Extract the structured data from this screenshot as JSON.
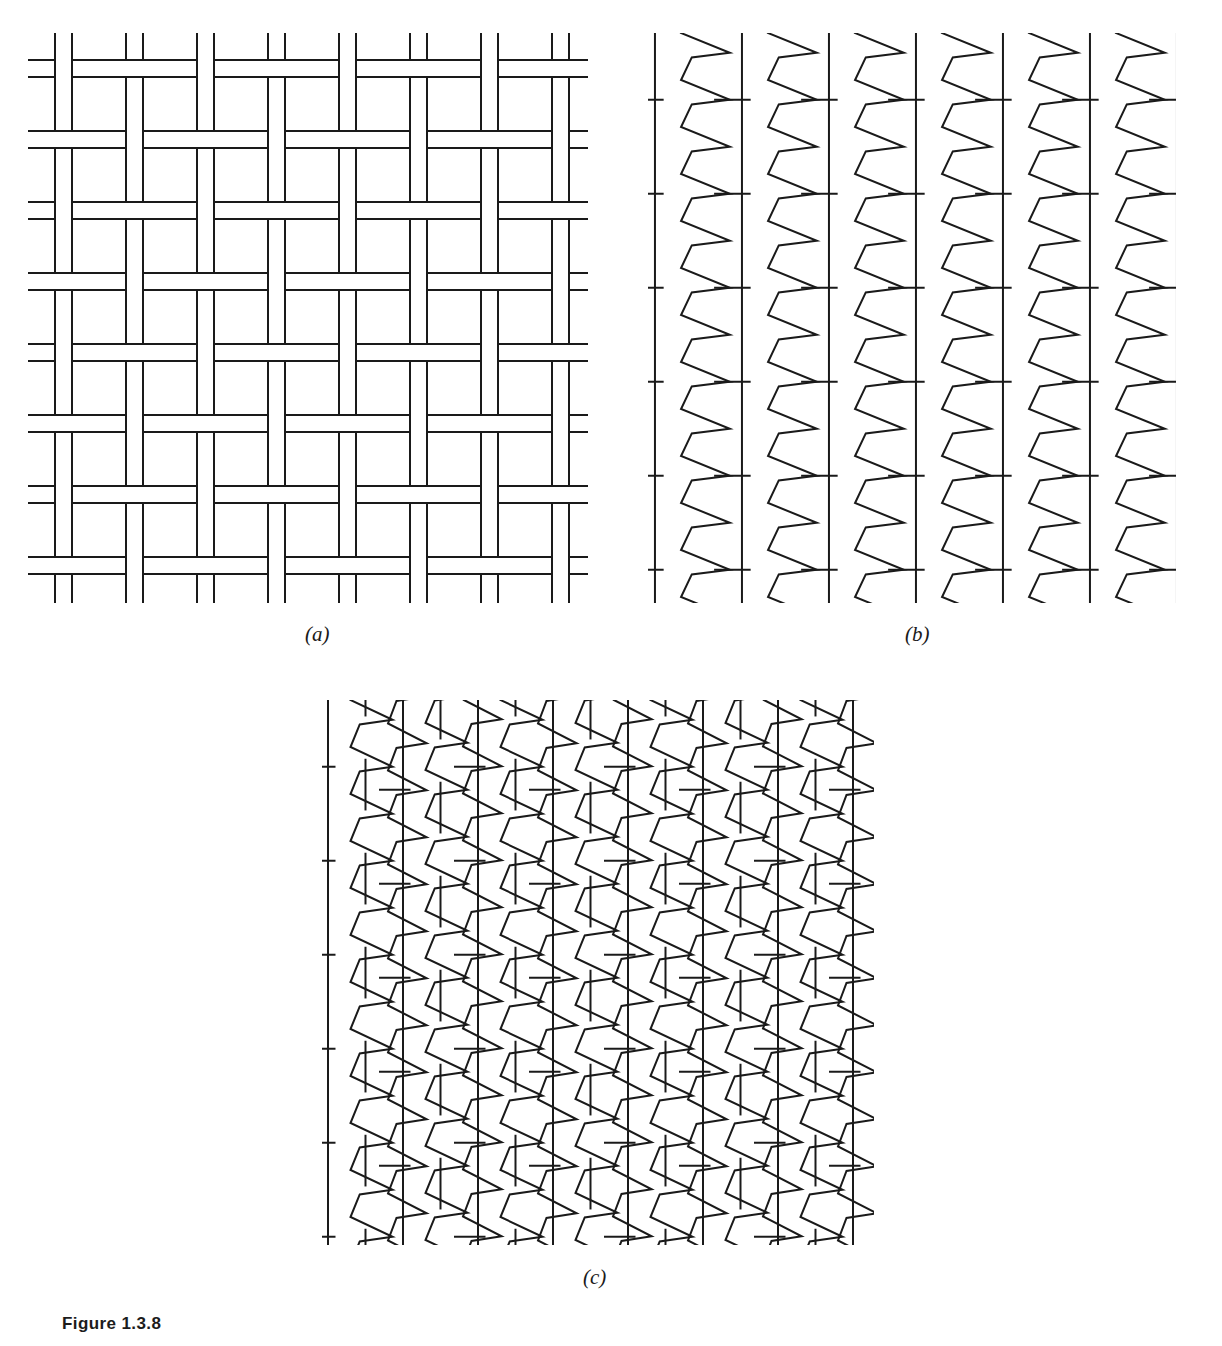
{
  "figure": {
    "caption": "Figure 1.3.8",
    "caption_x": 62,
    "caption_y": 1314,
    "background_color": "#ffffff",
    "ink_color": "#1a1a1a",
    "width": 1222,
    "height": 1346
  },
  "panels": [
    {
      "id": "a",
      "label": "(a)",
      "label_x": 305,
      "label_y": 622,
      "x": 28,
      "y": 33,
      "width": 560,
      "height": 570,
      "diagram_type": "basket-weave-2x2",
      "description": "Plain basket (hopsack) weave, 2 over 2",
      "stroke_width": 2.0,
      "cell": 71,
      "thread_gap": 17,
      "blocks_x": 8,
      "blocks_y": 8
    },
    {
      "id": "b",
      "label": "(b)",
      "label_x": 905,
      "label_y": 622,
      "x": 648,
      "y": 33,
      "width": 528,
      "height": 570,
      "diagram_type": "warp-knit-chevron",
      "description": "Knitted loop structure: straight vertical wales alternating with chevron loop columns",
      "stroke_width": 2.0,
      "column_pitch": 87,
      "row_pitch": 47,
      "columns": 6,
      "rows": 12
    },
    {
      "id": "c",
      "label": "(c)",
      "label_x": 583,
      "label_y": 1265,
      "x": 322,
      "y": 700,
      "width": 552,
      "height": 545,
      "diagram_type": "warp-knit-chevron-staggered",
      "description": "Knitted loop structure with laterally staggered (offset) chevron loop columns",
      "stroke_width": 2.0,
      "column_pitch": 75,
      "row_pitch": 47,
      "columns": 8,
      "rows": 12,
      "stagger_offset": 23
    }
  ]
}
